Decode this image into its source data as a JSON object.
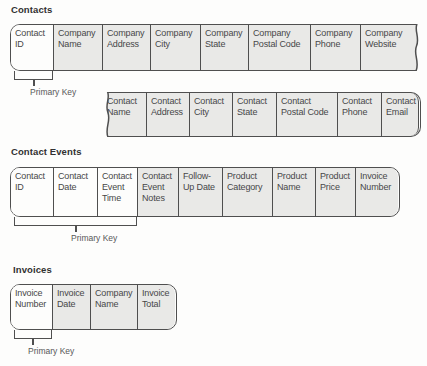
{
  "colors": {
    "page_background": "#fdfdfc",
    "cell_fill": "#e9e9e7",
    "primary_key_cell_fill": "#fdfdfc",
    "border": "#4f4f4f",
    "cell_text": "#474747",
    "heading_text": "#313131",
    "label_text": "#585858"
  },
  "tables": {
    "contacts": {
      "title": "Contacts",
      "row1_fields": [
        "Contact ID",
        "Company Name",
        "Company Address",
        "Company City",
        "Company State",
        "Company Postal Code",
        "Company Phone",
        "Company Website"
      ],
      "row2_fields": [
        "Contact Name",
        "Contact Address",
        "Contact City",
        "Contact State",
        "Contact Postal Code",
        "Contact Phone",
        "Contact Email"
      ],
      "primary_key_fields": [
        "Contact ID"
      ],
      "primary_key_label": "Primary Key"
    },
    "contact_events": {
      "title": "Contact Events",
      "fields": [
        "Contact ID",
        "Contact Date",
        "Contact Event Time",
        "Contact Event Notes",
        "Follow-Up Date",
        "Product Category",
        "Product Name",
        "Product Price",
        "Invoice Number"
      ],
      "primary_key_fields": [
        "Contact ID",
        "Contact Date",
        "Contact Event Time"
      ],
      "primary_key_label": "Primary Key"
    },
    "invoices": {
      "title": "Invoices",
      "fields": [
        "Invoice Number",
        "Invoice Date",
        "Company Name",
        "Invoice Total"
      ],
      "primary_key_fields": [
        "Invoice Number"
      ],
      "primary_key_label": "Primary Key"
    }
  }
}
